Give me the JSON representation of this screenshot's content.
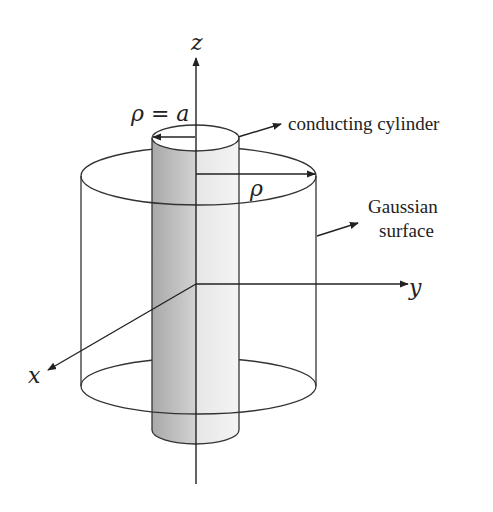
{
  "figure": {
    "type": "gauss-law-coaxial-diagram",
    "axes": {
      "z_label": "z",
      "y_label": "y",
      "x_label": "x"
    },
    "labels": {
      "inner_radius": "ρ = a",
      "gaussian_radius": "ρ",
      "conducting_cylinder": "conducting cylinder",
      "gaussian_line1": "Gaussian",
      "gaussian_line2": "surface"
    },
    "colors": {
      "stroke": "#333333",
      "cylinder_dark": "#b8b8b8",
      "cylinder_light": "#ececec",
      "background": "#ffffff"
    }
  }
}
